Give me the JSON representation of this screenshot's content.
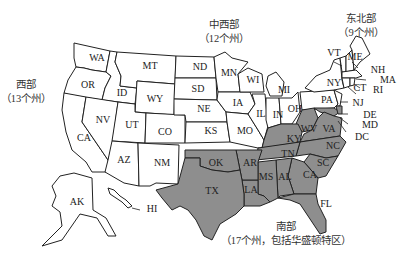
{
  "regions": {
    "west": {
      "name": "西部",
      "count": "（13个州）"
    },
    "midwest": {
      "name": "中西部",
      "count": "（12个州）"
    },
    "northeast": {
      "name": "东北部",
      "count": "（9个州）"
    },
    "south": {
      "name": "南部",
      "count": "（17个州，包括华盛顿特区）"
    }
  },
  "colors": {
    "south_fill": "#8e8e8e",
    "other_fill": "#ffffff",
    "border": "#222222"
  },
  "states": {
    "WA": "WA",
    "OR": "OR",
    "CA": "CA",
    "ID": "ID",
    "NV": "NV",
    "MT": "MT",
    "WY": "WY",
    "UT": "UT",
    "CO": "CO",
    "AZ": "AZ",
    "NM": "NM",
    "AK": "AK",
    "HI": "HI",
    "ND": "ND",
    "SD": "SD",
    "NE": "NE",
    "KS": "KS",
    "MN": "MN",
    "IA": "IA",
    "MO": "MO",
    "WI": "WI",
    "IL": "IL",
    "MI": "MI",
    "IN": "IN",
    "OH": "OH",
    "VT": "VT",
    "ME": "ME",
    "NH": "NH",
    "MA": "MA",
    "RI": "RI",
    "CT": "CT",
    "NY": "NY",
    "PA": "PA",
    "NJ": "NJ",
    "DE": "DE",
    "MD": "MD",
    "DC": "DC",
    "WV": "WV",
    "VA": "VA",
    "KY": "KY",
    "NC": "NC",
    "TN": "TN",
    "SC": "SC",
    "OK": "OK",
    "AR": "AR",
    "TX": "TX",
    "LA": "LA",
    "MS": "MS",
    "AL": "AL",
    "GA": "CA",
    "FL": "FL"
  }
}
